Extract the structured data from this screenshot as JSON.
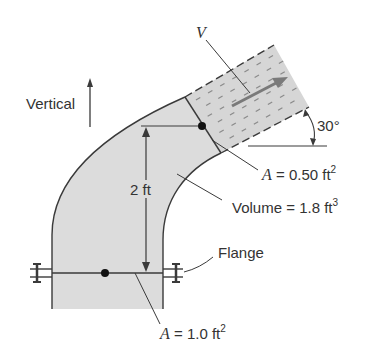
{
  "figure": {
    "vertical_label": "Vertical",
    "velocity_label": "V",
    "angle_label": "30°",
    "height_label": "2 ft",
    "outlet_area": {
      "prefix": "A",
      "text": " = 0.50 ft",
      "exp": "2"
    },
    "volume": {
      "text": "Volume = 1.8 ft",
      "exp": "3"
    },
    "flange_label": "Flange",
    "inlet_area": {
      "prefix": "A",
      "text": " = 1.0 ft",
      "exp": "2"
    }
  },
  "colors": {
    "pipe_fill": "#dcdcdc",
    "outline": "#3a3a3a",
    "arrow": "#7a7a7a",
    "text": "#333333"
  }
}
